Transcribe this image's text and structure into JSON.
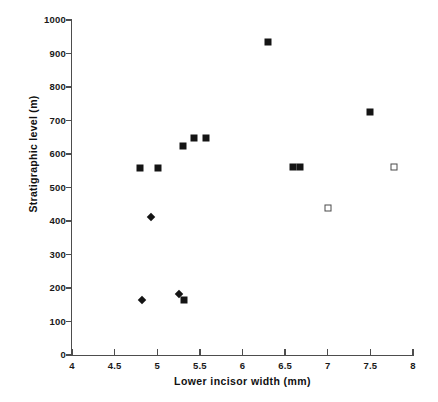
{
  "chart_data": {
    "type": "scatter",
    "title": "",
    "xlabel": "Lower incisor width (mm)",
    "ylabel": "Stratigraphic level (m)",
    "xlim": [
      4,
      8
    ],
    "ylim": [
      0,
      1000
    ],
    "xticks": [
      4,
      4.5,
      5,
      5.5,
      6,
      6.5,
      7,
      7.5,
      8
    ],
    "xtick_labels": [
      "4",
      "4.5",
      "5",
      "5.5",
      "6",
      "6.5",
      "7",
      "7.5",
      "8"
    ],
    "yticks": [
      0,
      100,
      200,
      300,
      400,
      500,
      600,
      700,
      800,
      900,
      1000
    ],
    "ytick_labels": [
      "0",
      "100",
      "200",
      "300",
      "400",
      "500",
      "600",
      "700",
      "800",
      "900",
      "1000"
    ],
    "grid": false,
    "legend": "none",
    "series": [
      {
        "name": "filled-square",
        "marker": "filled-square",
        "color": "#141414",
        "points": [
          {
            "x": 4.8,
            "y": 558
          },
          {
            "x": 5.01,
            "y": 558
          },
          {
            "x": 5.3,
            "y": 625
          },
          {
            "x": 5.43,
            "y": 647
          },
          {
            "x": 5.57,
            "y": 647
          },
          {
            "x": 6.3,
            "y": 933
          },
          {
            "x": 6.59,
            "y": 560
          },
          {
            "x": 6.68,
            "y": 560
          },
          {
            "x": 7.5,
            "y": 725
          },
          {
            "x": 5.31,
            "y": 163
          }
        ]
      },
      {
        "name": "diamond",
        "marker": "diamond",
        "color": "#141414",
        "points": [
          {
            "x": 4.93,
            "y": 412
          },
          {
            "x": 4.82,
            "y": 163
          },
          {
            "x": 5.26,
            "y": 183
          }
        ]
      },
      {
        "name": "open-square",
        "marker": "open-square",
        "color": "#4a4a4a",
        "points": [
          {
            "x": 7.0,
            "y": 438
          },
          {
            "x": 7.78,
            "y": 560
          }
        ]
      }
    ]
  },
  "axis": {
    "x_title": "Lower incisor width (mm)",
    "y_title": "Stratigraphic level (m)"
  }
}
